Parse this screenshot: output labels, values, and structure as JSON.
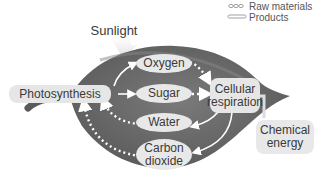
{
  "legend": {
    "raw_materials": "Raw materials",
    "products": "Products"
  },
  "sunlight": "Sunlight",
  "processes": {
    "photosynthesis": "Photosynthesis",
    "cellular_respiration_line1": "Cellular",
    "cellular_respiration_line2": "respiration",
    "chemical_energy_line1": "Chemical",
    "chemical_energy_line2": "energy"
  },
  "substances": {
    "oxygen": "Oxygen",
    "sugar": "Sugar",
    "water": "Water",
    "carbon_dioxide_line1": "Carbon",
    "carbon_dioxide_line2": "dioxide"
  },
  "colors": {
    "leaf": "#6e6e6e",
    "leaf_dark": "#555555",
    "oval": "#e8e8e8",
    "pill": "#e6e6e6",
    "arrow": "#ffffff"
  }
}
